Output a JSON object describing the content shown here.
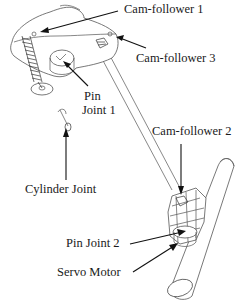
{
  "figure": {
    "type": "mechanical-assembly-diagram",
    "labels": {
      "cam_follower_1": "Cam-follower 1",
      "cam_follower_3": "Cam-follower 3",
      "pin_joint_1_line1": "Pin",
      "pin_joint_1_line2": "Joint 1",
      "cylinder_joint": "Cylinder Joint",
      "cam_follower_2": "Cam-follower 2",
      "pin_joint_2": "Pin Joint 2",
      "servo_motor": "Servo Motor"
    },
    "colors": {
      "line": "#555555",
      "arrow": "#111111",
      "text": "#1a1a1a",
      "background": "#ffffff"
    }
  }
}
